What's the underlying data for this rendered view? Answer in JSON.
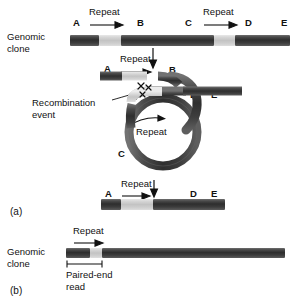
{
  "figure": {
    "title_absent": true,
    "panels": [
      {
        "id": "a",
        "label": "(a)"
      },
      {
        "id": "b",
        "label": "(b)"
      }
    ]
  },
  "labels": {
    "genomic_clone": "Genomic\nclone",
    "genomic_clone_b": "Genomic\nclone",
    "repeat": "Repeat",
    "recombination_event": "Recombination\nevent",
    "paired_end_read": "Paired-end\nread",
    "panel_a": "(a)",
    "panel_b": "(b)"
  },
  "panel_a": {
    "top_clone": {
      "name": "Genomic clone (parental, with two repeats)",
      "markers": [
        {
          "id": "A",
          "label": "A"
        },
        {
          "id": "B",
          "label": "B"
        },
        {
          "id": "C",
          "label": "C"
        },
        {
          "id": "D",
          "label": "D"
        },
        {
          "id": "E",
          "label": "E"
        }
      ],
      "repeat_labels": [
        {
          "label": "Repeat",
          "direction": "right"
        },
        {
          "label": "Repeat",
          "direction": "right"
        }
      ],
      "segments": [
        {
          "type": "dark",
          "start": 0,
          "end": 85
        },
        {
          "type": "light",
          "start": 85,
          "end": 148
        },
        {
          "type": "dark",
          "start": 148,
          "end": 418
        },
        {
          "type": "light",
          "start": 418,
          "end": 480
        },
        {
          "type": "dark",
          "start": 480,
          "end": 640
        }
      ]
    },
    "looped_clone": {
      "name": "Clone looped so the two repeats pair",
      "markers": [
        {
          "id": "A",
          "label": "A"
        },
        {
          "id": "B",
          "label": "B"
        },
        {
          "id": "C",
          "label": "C"
        },
        {
          "id": "D",
          "label": "D"
        },
        {
          "id": "E",
          "label": "E"
        }
      ],
      "repeat_label_top": "Repeat",
      "repeat_label_loop": "Repeat",
      "annotation": "Recombination\nevent"
    },
    "result_clone": {
      "name": "Deleted clone after recombination",
      "markers": [
        {
          "id": "A",
          "label": "A"
        },
        {
          "id": "D",
          "label": "D"
        },
        {
          "id": "E",
          "label": "E"
        }
      ],
      "repeat_label": "Repeat",
      "segments": [
        {
          "type": "dark",
          "start": 0,
          "end": 60
        },
        {
          "type": "light",
          "start": 60,
          "end": 152
        },
        {
          "type": "dark",
          "start": 152,
          "end": 370
        }
      ]
    }
  },
  "panel_b": {
    "clone": {
      "name": "Genomic clone with single repeat spanned by paired-end read",
      "repeat_label": "Repeat",
      "paired_end_label": "Paired-end\nread",
      "segments": [
        {
          "type": "dark",
          "start": 0,
          "end": 62
        },
        {
          "type": "light",
          "start": 62,
          "end": 92
        },
        {
          "type": "dark",
          "start": 92,
          "end": 560
        }
      ]
    }
  },
  "colors": {
    "bar_dark": "#3a3a3a",
    "bar_light": "#cfcfcf",
    "loop_stroke": "#4a4a4a",
    "text": "#111111",
    "background": "#ffffff"
  }
}
